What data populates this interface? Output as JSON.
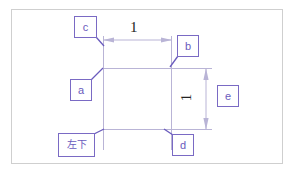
{
  "figure": {
    "frame": {
      "border_color": "#cfcfcf",
      "background": "#ffffff"
    },
    "accent_color": "#7a6ac4",
    "geometry_color": "#b9b4d6",
    "text_color": "#232323"
  },
  "shape": {
    "name": "rectangle",
    "corner_labels_note": "square outline with extension lines on all four sides"
  },
  "labels": {
    "c": "c",
    "b": "b",
    "a": "a",
    "e": "e",
    "d": "d",
    "bottom_left": "左下"
  },
  "dimensions": {
    "horizontal": {
      "value": "1",
      "orientation": "horizontal",
      "position": "top"
    },
    "vertical": {
      "value": "1",
      "orientation": "vertical",
      "position": "right"
    }
  }
}
